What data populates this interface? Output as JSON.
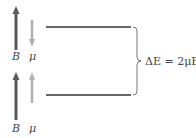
{
  "diagram": {
    "states": [
      {
        "name": "upper",
        "B_arrow": "up",
        "mu_arrow": "down",
        "B_label": "B",
        "mu_label": "μ",
        "level_y": 27
      },
      {
        "name": "lower",
        "B_arrow": "up",
        "mu_arrow": "up",
        "B_label": "B",
        "mu_label": "μ",
        "level_y": 95
      }
    ],
    "energy_gap_label": "ΔE = 2μB",
    "colors": {
      "B_arrow": "#5a5a5a",
      "mu_arrow": "#b0b0b0",
      "level_line": "#333333",
      "brace": "#777777"
    }
  }
}
